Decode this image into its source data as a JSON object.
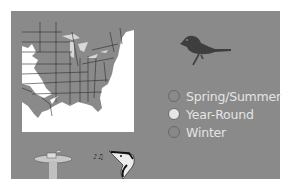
{
  "colors": {
    "background": "#ffffff",
    "panel": "#8a8a8a",
    "map_land": "#8a8a8a",
    "map_outside": "#ffffff",
    "bird_silhouette": "#3e3e3e",
    "legend_text": "#e4e4e4"
  },
  "legend": {
    "items": [
      {
        "label": "Spring/Summer",
        "color": "#8a8a8a"
      },
      {
        "label": "Year-Round",
        "color": "#e6e6e6"
      },
      {
        "label": "Winter",
        "color": "#888888"
      }
    ]
  },
  "icons": {
    "bird": "bird-silhouette-icon",
    "feeder": "bird-feeder-icon",
    "song": "bird-song-icon"
  }
}
